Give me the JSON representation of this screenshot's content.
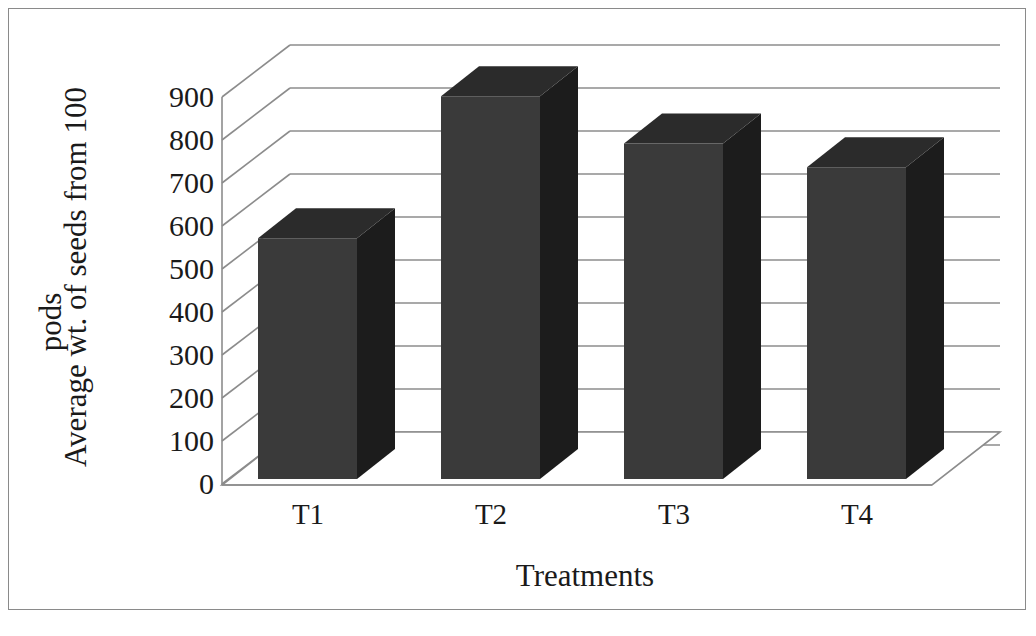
{
  "chart_data": {
    "type": "bar",
    "title": "",
    "subtitle": "",
    "xlabel": "Treatments",
    "ylabel": "Average wt. of seeds from 100 pods",
    "ylabel_line1": "Average wt. of seeds from 100",
    "ylabel_line2": "pods",
    "categories": [
      "T1",
      "T2",
      "T3",
      "T4"
    ],
    "values": [
      560,
      890,
      780,
      725
    ],
    "ylim": [
      0,
      900
    ],
    "ytick_values": [
      900,
      800,
      700,
      600,
      500,
      400,
      300,
      200,
      100,
      0
    ],
    "ytick_labels": [
      "900",
      "800",
      "700",
      "600",
      "500",
      "400",
      "300",
      "200",
      "100",
      "0"
    ],
    "ytick_step": 100,
    "grid": true,
    "grid_axis": "y",
    "legend": null,
    "legend_position": "none",
    "style": "3d-column",
    "series": [
      {
        "name": "Average wt. of seeds from 100 pods",
        "values": [
          560,
          890,
          780,
          725
        ]
      }
    ],
    "colors": {
      "bar_front": "#3a3a3a",
      "bar_top": "#2b2b2b",
      "bar_side": "#1c1c1c",
      "gridline": "#8c8c8c",
      "axis": "#6f6f6f",
      "text": "#1a1a1a",
      "background": "#ffffff",
      "border": "#8a8a8a"
    }
  },
  "axes": {
    "y_title": "Average wt. of seeds from 100 pods",
    "x_title": "Treatments"
  }
}
